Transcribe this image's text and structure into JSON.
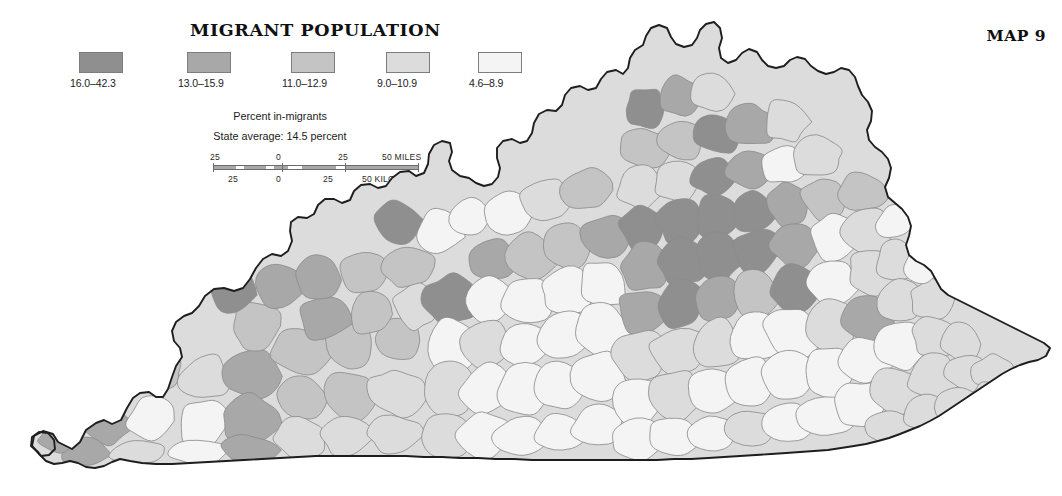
{
  "title": "MIGRANT POPULATION",
  "map_number": "MAP 9",
  "legend": {
    "caption": "Percent in-migrants",
    "subcaption": "State average: 14.5 percent",
    "classes": [
      {
        "label": "16.0–42.3",
        "color": "#8f8f8f",
        "left": 0
      },
      {
        "label": "13.0–15.9",
        "color": "#a8a8a8",
        "left": 108
      },
      {
        "label": "11.0–12.9",
        "color": "#c4c4c4",
        "left": 212
      },
      {
        "label": "9.0–10.9",
        "color": "#dcdcdc",
        "left": 307
      },
      {
        "label": "4.6–8.9",
        "color": "#f4f4f4",
        "left": 399
      }
    ]
  },
  "scalebar": {
    "miles_unit": "50 MILES",
    "kilometers_unit": "50 KILOMETERS",
    "top_ticks": [
      "25",
      "0",
      "25"
    ],
    "bottom_ticks": [
      "25",
      "0",
      "25"
    ]
  },
  "chart_data": {
    "type": "choropleth-map",
    "title": "MIGRANT POPULATION",
    "subtitle": "Percent in-migrants",
    "annotation": "State average: 14.5 percent",
    "region": "Kentucky counties",
    "classes": [
      {
        "range": "16.0–42.3",
        "min": 16.0,
        "max": 42.3,
        "color": "#8f8f8f"
      },
      {
        "range": "13.0–15.9",
        "min": 13.0,
        "max": 15.9,
        "color": "#a8a8a8"
      },
      {
        "range": "11.0–12.9",
        "min": 11.0,
        "max": 12.9,
        "color": "#c4c4c4"
      },
      {
        "range": "9.0–10.9",
        "min": 9.0,
        "max": 10.9,
        "color": "#dcdcdc"
      },
      {
        "range": "4.6–8.9",
        "min": 4.6,
        "max": 8.9,
        "color": "#f4f4f4"
      }
    ],
    "state_average": 14.5,
    "value_unit": "percent",
    "legend_position": "top-left",
    "grid": false
  }
}
